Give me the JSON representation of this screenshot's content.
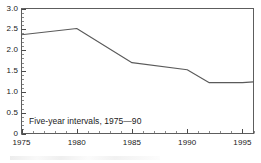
{
  "chart_data": {
    "type": "line",
    "title": "",
    "subtitle": "",
    "xlabel": "",
    "ylabel": "",
    "annotation": "Five-year intervals, 1975—90",
    "grid": false,
    "legend": "none",
    "xlim": [
      1975,
      1996
    ],
    "ylim": [
      0,
      3.0
    ],
    "y_ticks": [
      0,
      0.5,
      1.0,
      1.5,
      2.0,
      2.5,
      3.0
    ],
    "y_tick_labels": [
      "0",
      "0.5",
      "1.0",
      "1.5",
      "2.0",
      "2.5",
      "3.0"
    ],
    "y_minor_tick_step": 0.1,
    "x_ticks": [
      1975,
      1980,
      1985,
      1990,
      1995
    ],
    "x_tick_labels": [
      "1975",
      "1980",
      "1985",
      "1990",
      "1995"
    ],
    "x_minor_tick_step": 1,
    "series": [
      {
        "name": "rate",
        "color": "#5a5a5a",
        "x": [
          1975,
          1980,
          1985,
          1990,
          1992,
          1995,
          1996
        ],
        "values": [
          2.37,
          2.52,
          1.7,
          1.53,
          1.22,
          1.22,
          1.24
        ]
      }
    ]
  },
  "style": {
    "line_color": "#5a5a5a",
    "axis_color": "#5d5d5d",
    "text_color": "#202020",
    "background": "#ffffff"
  }
}
